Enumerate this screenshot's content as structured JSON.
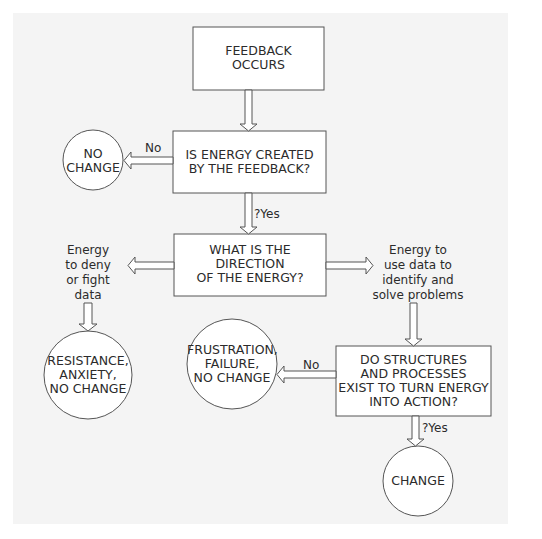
{
  "nodes": {
    "feedback_occurs": {
      "lines": [
        "FEEDBACK",
        "OCCURS"
      ]
    },
    "energy_created_q": {
      "lines": [
        "IS ENERGY CREATED",
        "BY THE FEEDBACK?"
      ]
    },
    "no_change": {
      "lines": [
        "NO",
        "CHANGE"
      ]
    },
    "direction_q": {
      "lines": [
        "WHAT IS THE",
        "DIRECTION",
        "OF THE ENERGY?"
      ]
    },
    "resistance": {
      "lines": [
        "RESISTANCE,",
        "ANXIETY,",
        "NO CHANGE"
      ]
    },
    "structures_q": {
      "lines": [
        "DO STRUCTURES",
        "AND PROCESSES",
        "EXIST TO TURN ENERGY",
        "INTO ACTION?"
      ]
    },
    "frustration": {
      "lines": [
        "FRUSTRATION,",
        "FAILURE,",
        "NO CHANGE"
      ]
    },
    "change": {
      "lines": [
        "CHANGE"
      ]
    }
  },
  "edge_labels": {
    "no_1": "No",
    "yes_1": "?Yes",
    "deny_lines": [
      "Energy",
      "to deny",
      "or fight",
      "data"
    ],
    "use_lines": [
      "Energy to",
      "use data to",
      "identify and",
      "solve problems"
    ],
    "no_2": "No",
    "yes_2": "?Yes"
  }
}
